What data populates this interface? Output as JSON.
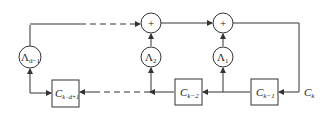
{
  "diagram": {
    "adders": [
      {
        "id": "adder-left",
        "symbol": "+"
      },
      {
        "id": "adder-right",
        "symbol": "+"
      }
    ],
    "multipliers": [
      {
        "id": "mult-d-1",
        "base": "Λ",
        "sub": "d−1"
      },
      {
        "id": "mult-2",
        "base": "Λ",
        "sub": "2"
      },
      {
        "id": "mult-1",
        "base": "Λ",
        "sub": "1"
      }
    ],
    "registers": [
      {
        "id": "reg-k-d+1",
        "base": "C",
        "sub": "k−d+1"
      },
      {
        "id": "reg-k-2",
        "base": "C",
        "sub": "k−2"
      },
      {
        "id": "reg-k-1",
        "base": "C",
        "sub": "k−1"
      }
    ],
    "input": {
      "base": "C",
      "sub": "k"
    },
    "colors": {
      "stroke": "#333333",
      "background": "#ffffff"
    }
  }
}
